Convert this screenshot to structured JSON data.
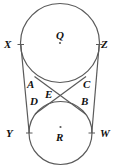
{
  "figure": {
    "type": "geometry-diagram",
    "background_color": "#ffffff",
    "stroke_color": "#5a5a5a",
    "label_color": "#111111"
  },
  "circles": [
    {
      "name": "circle-q",
      "center_label": "Q",
      "cx": 60,
      "cy": 43,
      "r": 39.5
    },
    {
      "name": "circle-r",
      "center_label": "R",
      "cx": 60.5,
      "cy": 133,
      "r": 31.5
    }
  ],
  "points": [
    {
      "key": "X",
      "label": "X",
      "x": 4,
      "y": 39
    },
    {
      "key": "Z",
      "label": "Z",
      "x": 101,
      "y": 39
    },
    {
      "key": "A",
      "label": "A",
      "x": 27,
      "y": 79
    },
    {
      "key": "C",
      "label": "C",
      "x": 83,
      "y": 79
    },
    {
      "key": "E",
      "label": "E",
      "x": 45,
      "y": 89
    },
    {
      "key": "D",
      "label": "D",
      "x": 30,
      "y": 96
    },
    {
      "key": "B",
      "label": "B",
      "x": 81,
      "y": 96
    },
    {
      "key": "Y",
      "label": "Y",
      "x": 6,
      "y": 128
    },
    {
      "key": "W",
      "label": "W",
      "x": 100,
      "y": 128
    }
  ],
  "tangent_lines": [
    {
      "name": "external-tangent-xy",
      "from": "X",
      "to": "Y",
      "x1": 20.8,
      "y1": 44.5,
      "x2": 29.2,
      "y2": 133
    },
    {
      "name": "external-tangent-zw",
      "from": "Z",
      "to": "W",
      "x1": 99.2,
      "y1": 44.5,
      "x2": 91.8,
      "y2": 133
    },
    {
      "name": "internal-tangent-ab",
      "from": "A",
      "to": "B",
      "x1": 34.5,
      "y1": 76.5,
      "x2": 85.5,
      "y2": 114
    },
    {
      "name": "internal-tangent-cd",
      "from": "C",
      "to": "D",
      "x1": 86.0,
      "y1": 76.5,
      "x2": 35.0,
      "y2": 114
    }
  ],
  "intersection": {
    "name": "E",
    "x": 60,
    "y": 96
  },
  "tick_marks": [
    {
      "name": "tick-x",
      "x": 20.8,
      "y": 44.5
    },
    {
      "name": "tick-z",
      "x": 99.2,
      "y": 44.5
    },
    {
      "name": "tick-y",
      "x": 29.2,
      "y": 133
    },
    {
      "name": "tick-w",
      "x": 91.8,
      "y": 133
    }
  ]
}
